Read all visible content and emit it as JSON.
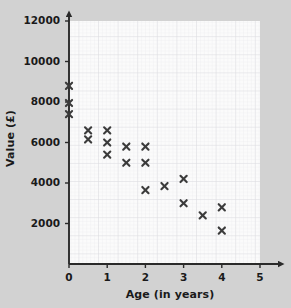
{
  "chart_data": {
    "type": "scatter",
    "title": "",
    "xlabel": "Age (in years)",
    "ylabel": "Value (£)",
    "xlim": [
      0,
      5
    ],
    "ylim": [
      0,
      12000
    ],
    "xticks": [
      0,
      1,
      2,
      3,
      4,
      5
    ],
    "yticks": [
      2000,
      4000,
      6000,
      8000,
      10000,
      12000
    ],
    "xtick_labels": [
      "0",
      "1",
      "2",
      "3",
      "4",
      "5"
    ],
    "ytick_labels": [
      "2000",
      "4000",
      "6000",
      "8000",
      "10000",
      "12000"
    ],
    "grid": true,
    "grid_minor_step_x": 0.1,
    "grid_minor_step_y": 200,
    "legend": "none",
    "marker": "x",
    "marker_color": "#3b3b3b",
    "points": [
      {
        "x": 0,
        "y": 8800
      },
      {
        "x": 0,
        "y": 7950
      },
      {
        "x": 0,
        "y": 7400
      },
      {
        "x": 0.5,
        "y": 6600
      },
      {
        "x": 0.5,
        "y": 6150
      },
      {
        "x": 1,
        "y": 6600
      },
      {
        "x": 1,
        "y": 6000
      },
      {
        "x": 1,
        "y": 5400
      },
      {
        "x": 1.5,
        "y": 5800
      },
      {
        "x": 1.5,
        "y": 5000
      },
      {
        "x": 2,
        "y": 5800
      },
      {
        "x": 2,
        "y": 5000
      },
      {
        "x": 2,
        "y": 3650
      },
      {
        "x": 2.5,
        "y": 3850
      },
      {
        "x": 3,
        "y": 4200
      },
      {
        "x": 3,
        "y": 3000
      },
      {
        "x": 3.5,
        "y": 2400
      },
      {
        "x": 4,
        "y": 2800
      },
      {
        "x": 4,
        "y": 1650
      }
    ]
  },
  "colors": {
    "background": "#d2d2d2",
    "plot_area": "#fbfbfb",
    "grid_minor": "#e6e6ea",
    "grid_major": "#dcdce2",
    "axis": "#2a2a2a",
    "text": "#1a1a1a",
    "marker": "#3b3b3b"
  }
}
